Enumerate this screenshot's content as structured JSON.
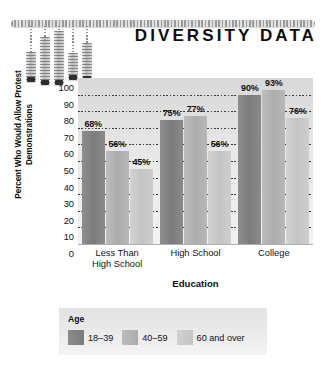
{
  "document": {
    "title": "DIVERSITY DATA"
  },
  "decoration": {
    "name": "hanging-bar-chart-ornament",
    "drops": [
      {
        "left": 30,
        "string_height": 26,
        "bar_height": 30
      },
      {
        "left": 44,
        "string_height": 11,
        "bar_height": 48
      },
      {
        "left": 58,
        "string_height": 5,
        "bar_height": 54
      },
      {
        "left": 72,
        "string_height": 27,
        "bar_height": 27
      },
      {
        "left": 86,
        "string_height": 17,
        "bar_height": 38
      }
    ]
  },
  "chart_data": {
    "type": "bar",
    "title": "",
    "xlabel": "Education",
    "ylabel": "Percent Who Would Allow Protest Demonstrations",
    "categories": [
      "Less Than High School",
      "High School",
      "College"
    ],
    "category_lines": [
      [
        "Less Than",
        "High School"
      ],
      [
        "High School"
      ],
      [
        "College"
      ]
    ],
    "series": [
      {
        "name": "18–39",
        "values": [
          68,
          75,
          90
        ],
        "color": "#7c7c7c"
      },
      {
        "name": "40–59",
        "values": [
          56,
          77,
          93
        ],
        "color": "#acacac"
      },
      {
        "name": "60 and over",
        "values": [
          45,
          56,
          76
        ],
        "color": "#c4c4c4"
      }
    ],
    "value_labels": [
      [
        "68%",
        "56%",
        "45%"
      ],
      [
        "75%",
        "77%",
        "56%"
      ],
      [
        "90%",
        "93%",
        "76%"
      ]
    ],
    "ylim": [
      0,
      100
    ],
    "yticks": [
      100,
      90,
      80,
      70,
      60,
      50,
      40,
      30,
      20,
      10,
      0
    ],
    "ytick_labels": [
      "100",
      "90",
      "80",
      "70",
      "60",
      "50",
      "40",
      "30",
      "20",
      "10",
      "0"
    ],
    "grid": true,
    "grid_style": "dotted",
    "legend_position": "bottom",
    "legend_title": "Age"
  }
}
